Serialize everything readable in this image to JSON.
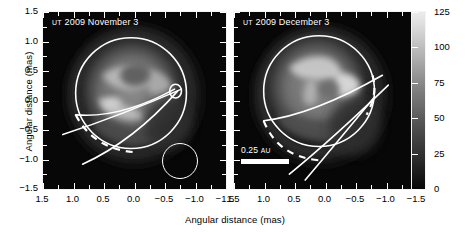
{
  "figure": {
    "xlabel": "Angular distance (mas)",
    "ylabel": "Angular distance (mas)",
    "colorbar_label": "Relative surface brightness (%)"
  },
  "panels": [
    {
      "id": "nov",
      "ut_prefix": "UT",
      "title": "2009 November 3"
    },
    {
      "id": "dec",
      "ut_prefix": "UT",
      "title": "2009 December 3"
    }
  ],
  "annotations": {
    "scale_bar_value": "0.25",
    "scale_bar_unit": "AU",
    "beam_name": "beam-size-circle"
  },
  "axis_ticks": {
    "x": [
      "1.5",
      "1.0",
      "0.5",
      "0.0",
      "-0.5",
      "-1.0",
      "-1.5"
    ],
    "y": [
      "1.5",
      "1.0",
      "0.5",
      "0.0",
      "-0.5",
      "-1.0",
      "-1.5"
    ],
    "colorbar": [
      "125",
      "100",
      "75",
      "50",
      "25",
      "0"
    ]
  },
  "chart_data": {
    "type": "heatmap",
    "xlabel": "Angular distance (mas)",
    "ylabel": "Angular distance (mas)",
    "xlim": [
      1.5,
      -1.5
    ],
    "ylim": [
      -1.5,
      1.5
    ],
    "x_axis_inverted": true,
    "grid": false,
    "colorbar": {
      "label": "Relative surface brightness (%)",
      "min": 0,
      "max": 125,
      "ticks": [
        0,
        25,
        50,
        75,
        100,
        125
      ],
      "colormap": "grayscale",
      "position": "right"
    },
    "panels": [
      {
        "name": "UT 2009 November 3",
        "epoch": "2009-11-03",
        "stellar_limb_circle": {
          "cx": 0.02,
          "cy": -0.02,
          "radius": 1.07
        },
        "features": [
          {
            "name": "dark-patch",
            "x": 0.1,
            "y": 0.5,
            "brightness": 62
          },
          {
            "name": "bright-ridge-upper-left",
            "x": 0.55,
            "y": 0.55,
            "brightness": 108
          },
          {
            "name": "bright-ridge-right",
            "x": -0.45,
            "y": 0.45,
            "brightness": 104
          },
          {
            "name": "bright-arc-lower-left",
            "x": 0.35,
            "y": -0.1,
            "brightness": 112
          },
          {
            "name": "limb-darkened-rim",
            "x": 0.0,
            "y": -1.0,
            "brightness": 30
          }
        ],
        "overlays": [
          {
            "name": "stellar-limb",
            "style": "solid"
          },
          {
            "name": "rotation-axis-line",
            "style": "solid"
          },
          {
            "name": "equator-near-side",
            "style": "solid"
          },
          {
            "name": "equator-far-side",
            "style": "dashed"
          },
          {
            "name": "beam-size-circle",
            "style": "solid",
            "radius_mas": 0.28
          }
        ]
      },
      {
        "name": "UT 2009 December 3",
        "epoch": "2009-12-03",
        "stellar_limb_circle": {
          "cx": 0.02,
          "cy": -0.02,
          "radius": 1.07
        },
        "features": [
          {
            "name": "bright-patch-upper",
            "x": 0.2,
            "y": 0.7,
            "brightness": 116
          },
          {
            "name": "bright-patch-right",
            "x": -0.35,
            "y": 0.45,
            "brightness": 122
          },
          {
            "name": "dark-lane-center",
            "x": 0.15,
            "y": 0.35,
            "brightness": 70
          },
          {
            "name": "bright-band-lower",
            "x": 0.4,
            "y": -0.15,
            "brightness": 96
          },
          {
            "name": "limb-darkened-rim",
            "x": 0.0,
            "y": -1.0,
            "brightness": 28
          }
        ],
        "overlays": [
          {
            "name": "stellar-limb",
            "style": "solid"
          },
          {
            "name": "rotation-axis-line",
            "style": "solid"
          },
          {
            "name": "equator-near-side",
            "style": "solid"
          },
          {
            "name": "equator-far-side",
            "style": "dashed"
          },
          {
            "name": "scale-bar",
            "label": "0.25 AU"
          }
        ]
      }
    ]
  }
}
